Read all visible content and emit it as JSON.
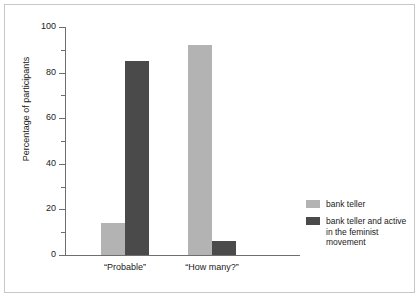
{
  "chart_data": {
    "type": "bar",
    "title": "",
    "xlabel": "",
    "ylabel": "Percentage of participants",
    "ylim": [
      0,
      100
    ],
    "ytick_labels": [
      "0",
      "20",
      "40",
      "60",
      "80",
      "100"
    ],
    "ytick_values": [
      0,
      20,
      40,
      60,
      80,
      100
    ],
    "yminor_values": [
      10,
      30,
      50,
      70,
      90
    ],
    "grid": false,
    "legend_position": "right",
    "categories": [
      "“Probable”",
      "“How many?”"
    ],
    "series": [
      {
        "name": "bank teller",
        "color": "#b3b3b3",
        "values": [
          14,
          92
        ]
      },
      {
        "name": "bank teller and active in the feminist movement",
        "color": "#4a4a4a",
        "values": [
          85,
          6
        ]
      }
    ]
  },
  "legend": {
    "entries": [
      {
        "label": "bank teller",
        "color": "#b3b3b3"
      },
      {
        "label": "bank teller and active in the feminist movement",
        "color": "#4a4a4a"
      }
    ]
  },
  "axis": {
    "y_title": "Percentage of participants",
    "y_labels": [
      "100",
      "80",
      "60",
      "40",
      "20",
      "0"
    ],
    "x_labels": [
      "“Probable”",
      "“How many?”"
    ]
  },
  "colors": {
    "light_series": "#b3b3b3",
    "dark_series": "#4a4a4a",
    "axis": "#6e6e6e",
    "frame": "#c8c8c8",
    "text": "#1a1a1a",
    "background": "#ffffff"
  }
}
